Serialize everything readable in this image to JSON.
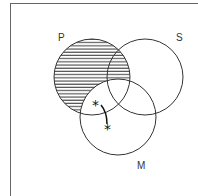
{
  "diagram": {
    "type": "venn-3-set",
    "sets": [
      {
        "label": "P",
        "cx": 92,
        "cy": 77,
        "r": 38,
        "label_x": 58,
        "label_y": 41
      },
      {
        "label": "S",
        "cx": 145,
        "cy": 77,
        "r": 38,
        "label_x": 176,
        "label_y": 41
      },
      {
        "label": "M",
        "cx": 118,
        "cy": 117,
        "r": 38,
        "label_x": 137,
        "label_y": 169
      }
    ],
    "shaded_region": "P outside M",
    "markers": [
      {
        "symbol": "*",
        "x": 97,
        "y": 108,
        "region": "P and M, not S"
      },
      {
        "symbol": "*",
        "x": 110,
        "y": 132,
        "region": "M only"
      }
    ],
    "colors": {
      "stroke": "#333333",
      "hatch": "#333333",
      "frame": "#666666"
    }
  }
}
